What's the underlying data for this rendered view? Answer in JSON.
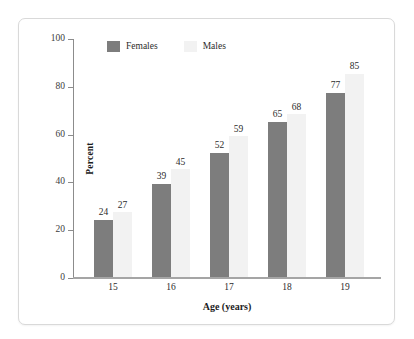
{
  "chart_data": {
    "type": "bar",
    "title": "",
    "subtitle": "",
    "categories": [
      "15",
      "16",
      "17",
      "18",
      "19"
    ],
    "series": [
      {
        "name": "Females",
        "values": [
          24,
          39,
          52,
          65,
          77
        ],
        "color": "#7d7d7d"
      },
      {
        "name": "Males",
        "values": [
          27,
          45,
          59,
          68,
          85
        ],
        "color": "#f2f2f2"
      }
    ],
    "xlabel": "Age (years)",
    "ylabel": "Percent",
    "ylim": [
      0,
      100
    ],
    "yticks": [
      0,
      20,
      40,
      60,
      80,
      100
    ],
    "ytick_labels": [
      "0",
      "20",
      "40",
      "60",
      "80",
      "100"
    ],
    "grid": false,
    "legend_position": "top-left-inside",
    "data_labels": true
  },
  "legend": {
    "items": [
      {
        "label": "Females",
        "color": "#7d7d7d"
      },
      {
        "label": "Males",
        "color": "#f2f2f2"
      }
    ]
  },
  "axes": {
    "y_title": "Percent",
    "x_title": "Age (years)"
  },
  "colors": {
    "female_bar": "#7d7d7d",
    "male_bar": "#f2f2f2",
    "axis": "#8c8c8c",
    "frame": "#d9d9d9",
    "text": "#2b2b2b"
  }
}
